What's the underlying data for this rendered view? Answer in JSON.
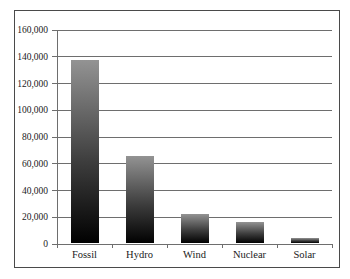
{
  "chart_data": {
    "type": "bar",
    "title": "",
    "xlabel": "",
    "ylabel": "",
    "categories": [
      "Fossil",
      "Hydro",
      "Wind",
      "Nuclear",
      "Solar"
    ],
    "values": [
      137000,
      65000,
      22000,
      16000,
      4000
    ],
    "ylim": [
      0,
      160000
    ],
    "ytick_interval": 20000,
    "ytick_labels": [
      "0",
      "20,000",
      "40,000",
      "60,000",
      "80,000",
      "100,000",
      "120,000",
      "140,000",
      "160,000"
    ],
    "grid": true,
    "legend": false,
    "colors": {
      "bar_gradient_top": "#939393",
      "bar_gradient_mid": "#3e3e3e",
      "bar_gradient_bottom": "#010101",
      "gridline": "#6e6e6e",
      "axis": "#6e6e6e",
      "frame_border": "#4a4a4a",
      "label_text": "#1a1a1a",
      "background": "#ffffff"
    }
  }
}
